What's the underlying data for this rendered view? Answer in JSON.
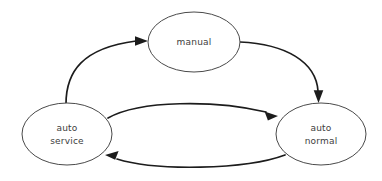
{
  "diagram": {
    "background_color": "#ffffff",
    "node_fill": "#ffffff",
    "node_stroke": "#4a4a4a",
    "edge_color": "#1c1c1c",
    "label_color": "#3d3d3d",
    "nodes": [
      {
        "id": "manual",
        "label_lines": [
          "manual"
        ],
        "line1": "manual",
        "cx": 194,
        "cy": 42,
        "rx": 46,
        "ry": 30
      },
      {
        "id": "auto-service",
        "label_lines": [
          "auto",
          "service"
        ],
        "line1": "auto",
        "line2": "service",
        "cx": 67,
        "cy": 134,
        "rx": 45,
        "ry": 31
      },
      {
        "id": "auto-normal",
        "label_lines": [
          "auto",
          "normal"
        ],
        "line1": "auto",
        "line2": "normal",
        "cx": 321,
        "cy": 134,
        "rx": 45,
        "ry": 31
      }
    ],
    "edges": [
      {
        "id": "auto-service-to-manual",
        "from": "auto-service",
        "to": "manual",
        "label": ""
      },
      {
        "id": "manual-to-auto-normal",
        "from": "manual",
        "to": "auto-normal",
        "label": ""
      },
      {
        "id": "auto-service-to-auto-normal",
        "from": "auto-service",
        "to": "auto-normal",
        "label": ""
      },
      {
        "id": "auto-normal-to-auto-service",
        "from": "auto-normal",
        "to": "auto-service",
        "label": ""
      }
    ]
  }
}
